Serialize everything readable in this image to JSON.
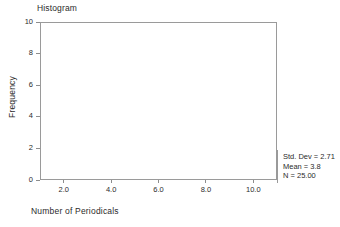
{
  "chart_data": {
    "type": "bar",
    "title": "Histogram",
    "xlabel": "Number of Periodicals",
    "ylabel": "Frequency",
    "x_ticks": [
      "2.0",
      "4.0",
      "6.0",
      "8.0",
      "10.0"
    ],
    "x_tick_values": [
      2.0,
      4.0,
      6.0,
      8.0,
      10.0
    ],
    "y_ticks": [
      "0",
      "2",
      "4",
      "6",
      "8",
      "10"
    ],
    "y_tick_values": [
      0,
      2,
      4,
      6,
      8,
      10
    ],
    "xlim": [
      1.0,
      11.0
    ],
    "ylim": [
      0,
      10
    ],
    "grid": false,
    "legend": null,
    "categories": [],
    "values": [],
    "annotations": [
      "Std. Dev = 2.71",
      "Mean = 3.8",
      "N = 25.00"
    ]
  },
  "stats": {
    "std_dev": "Std. Dev = 2.71",
    "mean": "Mean = 3.8",
    "n": "N = 25.00"
  },
  "colors": {
    "axis": "#9a9a9a",
    "tick": "#8d8d8d",
    "text": "#2b2b2b",
    "background": "#ffffff"
  }
}
